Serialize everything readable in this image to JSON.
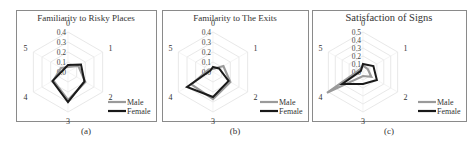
{
  "chart_data": [
    {
      "type": "radar",
      "id": "a",
      "title": "Familiarity to Risky Places",
      "caption": "(a)",
      "axes": [
        "0",
        "1",
        "2",
        "3",
        "4",
        "5"
      ],
      "radial_ticks": [
        "0.0",
        "0.1",
        "0.2",
        "0.3",
        "0.4"
      ],
      "rmax": 0.4,
      "legend_position": "bottom-right",
      "series": [
        {
          "name": "Male",
          "color": "#9a9a9a",
          "values": [
            0.05,
            0.12,
            0.2,
            0.28,
            0.17,
            0.08
          ]
        },
        {
          "name": "Female",
          "color": "#1a1a1a",
          "values": [
            0.07,
            0.15,
            0.19,
            0.3,
            0.18,
            0.05
          ]
        }
      ]
    },
    {
      "type": "radar",
      "id": "b",
      "title": "Familarity to The Exits",
      "caption": "(b)",
      "axes": [
        "0",
        "1",
        "2",
        "3",
        "4",
        "5"
      ],
      "radial_ticks": [
        "0.0",
        "0.1",
        "0.2",
        "0.3",
        "0.4"
      ],
      "rmax": 0.4,
      "legend_position": "bottom-right",
      "series": [
        {
          "name": "Male",
          "color": "#9a9a9a",
          "values": [
            0.03,
            0.12,
            0.2,
            0.27,
            0.25,
            0.05
          ]
        },
        {
          "name": "Female",
          "color": "#1a1a1a",
          "values": [
            0.05,
            0.07,
            0.18,
            0.25,
            0.3,
            0.03
          ]
        }
      ]
    },
    {
      "type": "radar",
      "id": "c",
      "title": "Satisfaction of Signs",
      "caption": "(c)",
      "axes": [
        "0",
        "1",
        "2",
        "3",
        "4",
        "5"
      ],
      "radial_ticks": [
        "0.0",
        "0.1",
        "0.2",
        "0.3",
        "0.4",
        "0.5"
      ],
      "rmax": 0.5,
      "legend_position": "bottom-right",
      "series": [
        {
          "name": "Male",
          "color": "#9a9a9a",
          "values": [
            0.08,
            0.07,
            0.12,
            0.05,
            0.52,
            0.05
          ]
        },
        {
          "name": "Female",
          "color": "#1a1a1a",
          "values": [
            0.1,
            0.15,
            0.2,
            0.15,
            0.3,
            0.03
          ]
        }
      ]
    }
  ],
  "panels": [
    {
      "left": 16,
      "width": 140,
      "cx": 68,
      "cy": 72,
      "R": 40
    },
    {
      "left": 162,
      "width": 146,
      "cx": 213,
      "cy": 72,
      "R": 40
    },
    {
      "left": 312,
      "width": 154,
      "cx": 363,
      "cy": 72,
      "R": 40
    }
  ]
}
